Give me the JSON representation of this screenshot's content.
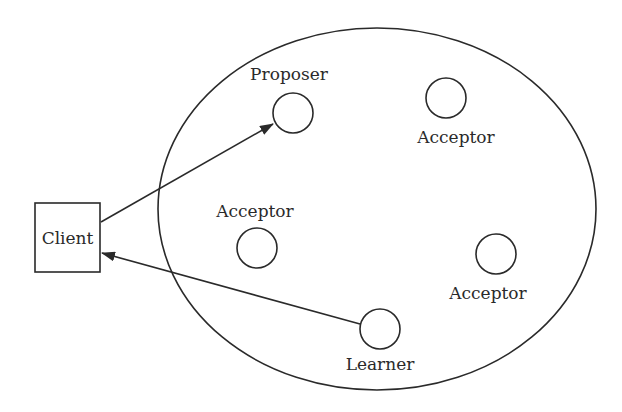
{
  "diagram": {
    "title": "",
    "colors": {
      "stroke": "#2a2a2a",
      "background": "#ffffff"
    },
    "client": {
      "label": "Client"
    },
    "nodes": [
      {
        "id": "proposer",
        "label": "Proposer"
      },
      {
        "id": "acceptor-top",
        "label": "Acceptor"
      },
      {
        "id": "acceptor-left",
        "label": "Acceptor"
      },
      {
        "id": "acceptor-right",
        "label": "Acceptor"
      },
      {
        "id": "learner",
        "label": "Learner"
      }
    ],
    "edges": [
      {
        "from": "Client",
        "to": "Proposer"
      },
      {
        "from": "Learner",
        "to": "Client"
      }
    ]
  }
}
